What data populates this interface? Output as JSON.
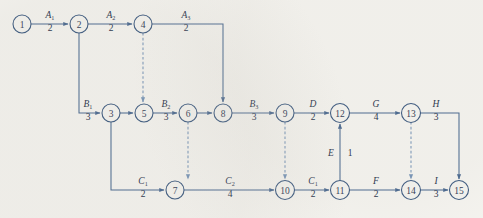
{
  "diagram": {
    "type": "activity-on-arrow-network",
    "title": "",
    "colors": {
      "background": "#f7f6f2",
      "node_stroke": "#2f4f79",
      "edge": "#3e5f8a",
      "dummy_edge": "#6f8fb5",
      "text": "#12253d"
    },
    "nodes": [
      {
        "id": "1",
        "label": "1",
        "x": 22,
        "y": 24,
        "r": 9
      },
      {
        "id": "2",
        "label": "2",
        "x": 79,
        "y": 24,
        "r": 9
      },
      {
        "id": "4",
        "label": "4",
        "x": 143,
        "y": 24,
        "r": 9
      },
      {
        "id": "3",
        "label": "3",
        "x": 111,
        "y": 113,
        "r": 9
      },
      {
        "id": "5",
        "label": "5",
        "x": 144,
        "y": 113,
        "r": 9
      },
      {
        "id": "6",
        "label": "6",
        "x": 188,
        "y": 113,
        "r": 9
      },
      {
        "id": "8",
        "label": "8",
        "x": 223,
        "y": 113,
        "r": 9
      },
      {
        "id": "9",
        "label": "9",
        "x": 285,
        "y": 113,
        "r": 9
      },
      {
        "id": "12",
        "label": "12",
        "x": 340,
        "y": 113,
        "r": 9
      },
      {
        "id": "13",
        "label": "13",
        "x": 411,
        "y": 113,
        "r": 9
      },
      {
        "id": "7",
        "label": "7",
        "x": 175,
        "y": 190,
        "r": 9
      },
      {
        "id": "10",
        "label": "10",
        "x": 285,
        "y": 190,
        "r": 9
      },
      {
        "id": "11",
        "label": "11",
        "x": 340,
        "y": 190,
        "r": 9
      },
      {
        "id": "14",
        "label": "14",
        "x": 411,
        "y": 190,
        "r": 9
      },
      {
        "id": "15",
        "label": "15",
        "x": 459,
        "y": 190,
        "r": 9
      }
    ],
    "edges": [
      {
        "id": "e-1-2",
        "from": "1",
        "to": "2",
        "name": "A",
        "sub": "1",
        "duration": "2",
        "dummy": false,
        "label_x": 50,
        "name_y": 17,
        "dur_y": 30
      },
      {
        "id": "e-2-4",
        "from": "2",
        "to": "4",
        "name": "A",
        "sub": "2",
        "duration": "2",
        "dummy": false,
        "label_x": 111,
        "name_y": 17,
        "dur_y": 30
      },
      {
        "id": "e-4-8",
        "from": "4",
        "to": "8",
        "name": "A",
        "sub": "3",
        "duration": "2",
        "dummy": false,
        "label_x": 186,
        "name_y": 17,
        "dur_y": 30
      },
      {
        "id": "e-2-3",
        "from": "2",
        "to": "3",
        "name": "B",
        "sub": "1",
        "duration": "3",
        "dummy": false,
        "label_x": 88,
        "name_y": 106,
        "dur_y": 119
      },
      {
        "id": "e-3-5",
        "from": "3",
        "to": "5",
        "name": "",
        "sub": "",
        "duration": "",
        "dummy": false,
        "label_x": 0,
        "name_y": 0,
        "dur_y": 0
      },
      {
        "id": "e-5-6",
        "from": "5",
        "to": "6",
        "name": "B",
        "sub": "2",
        "duration": "3",
        "dummy": false,
        "label_x": 166,
        "name_y": 106,
        "dur_y": 119
      },
      {
        "id": "e-6-8",
        "from": "6",
        "to": "8",
        "name": "",
        "sub": "",
        "duration": "",
        "dummy": false,
        "label_x": 0,
        "name_y": 0,
        "dur_y": 0
      },
      {
        "id": "e-8-9",
        "from": "8",
        "to": "9",
        "name": "B",
        "sub": "3",
        "duration": "3",
        "dummy": false,
        "label_x": 254,
        "name_y": 106,
        "dur_y": 119
      },
      {
        "id": "e-9-12",
        "from": "9",
        "to": "12",
        "name": "D",
        "sub": "",
        "duration": "2",
        "dummy": false,
        "label_x": 313,
        "name_y": 106,
        "dur_y": 119
      },
      {
        "id": "e-12-13",
        "from": "12",
        "to": "13",
        "name": "G",
        "sub": "",
        "duration": "4",
        "dummy": false,
        "label_x": 376,
        "name_y": 106,
        "dur_y": 119
      },
      {
        "id": "e-13-15",
        "from": "13",
        "to": "15",
        "name": "H",
        "sub": "",
        "duration": "3",
        "dummy": false,
        "label_x": 436,
        "name_y": 106,
        "dur_y": 119
      },
      {
        "id": "e-3-7",
        "from": "3",
        "to": "7",
        "name": "C",
        "sub": "1",
        "duration": "2",
        "dummy": false,
        "label_x": 143,
        "name_y": 183,
        "dur_y": 196
      },
      {
        "id": "e-7-10",
        "from": "7",
        "to": "10",
        "name": "C",
        "sub": "2",
        "duration": "4",
        "dummy": false,
        "label_x": 230,
        "name_y": 183,
        "dur_y": 196
      },
      {
        "id": "e-10-11",
        "from": "10",
        "to": "11",
        "name": "C",
        "sub": "1",
        "duration": "2",
        "dummy": false,
        "label_x": 313,
        "name_y": 183,
        "dur_y": 196
      },
      {
        "id": "e-11-12",
        "from": "11",
        "to": "12",
        "name": "E",
        "sub": "",
        "duration": "1",
        "dummy": false,
        "label_x": 332,
        "name_y": 155,
        "dur_y": 155
      },
      {
        "id": "e-11-14",
        "from": "11",
        "to": "14",
        "name": "F",
        "sub": "",
        "duration": "2",
        "dummy": false,
        "label_x": 376,
        "name_y": 183,
        "dur_y": 196
      },
      {
        "id": "e-14-15",
        "from": "14",
        "to": "15",
        "name": "I",
        "sub": "",
        "duration": "3",
        "dummy": false,
        "label_x": 436,
        "name_y": 183,
        "dur_y": 196
      },
      {
        "id": "e-4-5",
        "from": "4",
        "to": "5",
        "name": "",
        "sub": "",
        "duration": "",
        "dummy": true,
        "label_x": 0,
        "name_y": 0,
        "dur_y": 0
      },
      {
        "id": "e-6-7",
        "from": "6",
        "to": "7",
        "name": "",
        "sub": "",
        "duration": "",
        "dummy": true,
        "label_x": 0,
        "name_y": 0,
        "dur_y": 0
      },
      {
        "id": "e-9-10",
        "from": "9",
        "to": "10",
        "name": "",
        "sub": "",
        "duration": "",
        "dummy": true,
        "label_x": 0,
        "name_y": 0,
        "dur_y": 0
      },
      {
        "id": "e-13-14",
        "from": "13",
        "to": "14",
        "name": "",
        "sub": "",
        "duration": "",
        "dummy": true,
        "label_x": 0,
        "name_y": 0,
        "dur_y": 0
      }
    ],
    "edge_labels": [
      {
        "id": "lbl-A1",
        "name": "A",
        "sub": "1",
        "duration": "2",
        "x": 50,
        "name_y": 18,
        "dur_y": 31
      },
      {
        "id": "lbl-A2",
        "name": "A",
        "sub": "2",
        "duration": "2",
        "x": 111,
        "name_y": 18,
        "dur_y": 31
      },
      {
        "id": "lbl-A3",
        "name": "A",
        "sub": "3",
        "duration": "2",
        "x": 186,
        "name_y": 18,
        "dur_y": 31
      },
      {
        "id": "lbl-B1",
        "name": "B",
        "sub": "1",
        "duration": "3",
        "x": 88,
        "name_y": 107,
        "dur_y": 120
      },
      {
        "id": "lbl-B2",
        "name": "B",
        "sub": "2",
        "duration": "3",
        "x": 166,
        "name_y": 107,
        "dur_y": 120
      },
      {
        "id": "lbl-B3",
        "name": "B",
        "sub": "3",
        "duration": "3",
        "x": 254,
        "name_y": 107,
        "dur_y": 120
      },
      {
        "id": "lbl-D",
        "name": "D",
        "sub": "",
        "duration": "2",
        "x": 313,
        "name_y": 107,
        "dur_y": 120
      },
      {
        "id": "lbl-G",
        "name": "G",
        "sub": "",
        "duration": "4",
        "x": 376,
        "name_y": 107,
        "dur_y": 120
      },
      {
        "id": "lbl-H",
        "name": "H",
        "sub": "",
        "duration": "3",
        "x": 436,
        "name_y": 107,
        "dur_y": 120
      },
      {
        "id": "lbl-C1",
        "name": "C",
        "sub": "1",
        "duration": "2",
        "x": 143,
        "name_y": 184,
        "dur_y": 197
      },
      {
        "id": "lbl-C2",
        "name": "C",
        "sub": "2",
        "duration": "4",
        "x": 230,
        "name_y": 184,
        "dur_y": 197
      },
      {
        "id": "lbl-C3",
        "name": "C",
        "sub": "1",
        "duration": "2",
        "x": 313,
        "name_y": 184,
        "dur_y": 197
      },
      {
        "id": "lbl-F",
        "name": "F",
        "sub": "",
        "duration": "2",
        "x": 376,
        "name_y": 184,
        "dur_y": 197
      },
      {
        "id": "lbl-I",
        "name": "I",
        "sub": "",
        "duration": "3",
        "x": 436,
        "name_y": 184,
        "dur_y": 197
      }
    ],
    "vertical_label": {
      "id": "lbl-E",
      "name": "E",
      "duration": "1",
      "name_x": 331,
      "dur_x": 350,
      "y": 156
    }
  }
}
